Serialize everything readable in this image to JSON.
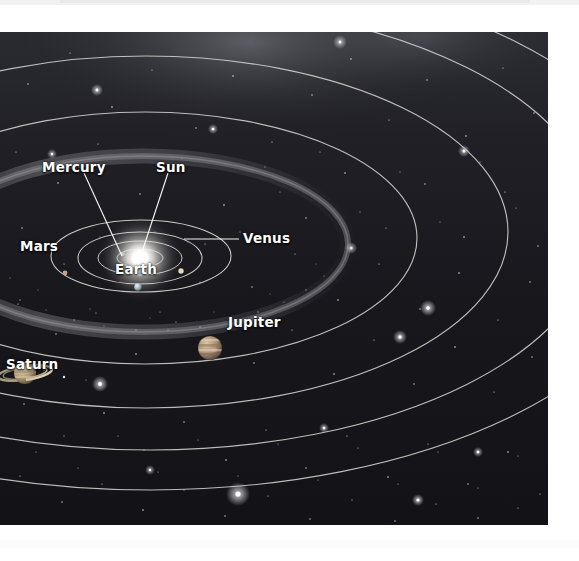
{
  "page": {
    "background": "#ffffff",
    "plate_background": "#17171c"
  },
  "diagram": {
    "type": "solar-system-orbit-diagram",
    "viewpoint": "oblique / inclined perspective view of the ecliptic plane",
    "star_color": "#ffffff",
    "orbit_line_color": "#c9c9c4",
    "sun_glow_color": "#ffffff",
    "milky_way_glow_color": "#8f8f96",
    "labels": [
      {
        "id": "mercury",
        "text": "Mercury",
        "x": 42,
        "y": 161
      },
      {
        "id": "sun",
        "text": "Sun",
        "x": 156,
        "y": 161
      },
      {
        "id": "venus",
        "text": "Venus",
        "x": 243,
        "y": 232
      },
      {
        "id": "mars",
        "text": "Mars",
        "x": 20,
        "y": 240
      },
      {
        "id": "earth",
        "text": "Earth",
        "x": 115,
        "y": 263
      },
      {
        "id": "jupiter",
        "text": "Jupiter",
        "x": 228,
        "y": 316
      },
      {
        "id": "saturn",
        "text": "Saturn",
        "x": 6,
        "y": 358
      }
    ],
    "bodies": [
      {
        "id": "sun",
        "name": "Sun",
        "cx": 140,
        "cy": 226,
        "r": 9,
        "color": "#ffffff"
      },
      {
        "id": "mercury",
        "name": "Mercury",
        "cx": 123,
        "cy": 222,
        "r": 1.8,
        "color": "#cfc8bd"
      },
      {
        "id": "venus",
        "name": "Venus",
        "cx": 181,
        "cy": 239,
        "r": 2.6,
        "color": "#ded3b8"
      },
      {
        "id": "earth",
        "name": "Earth",
        "cx": 138,
        "cy": 255,
        "r": 3.6,
        "color": "#b9c6cf"
      },
      {
        "id": "mars",
        "name": "Mars",
        "cx": 65,
        "cy": 241,
        "r": 2.4,
        "color": "#c9a187"
      },
      {
        "id": "jupiter",
        "name": "Jupiter",
        "cx": 210,
        "cy": 316,
        "r": 12,
        "color": "#b49c82"
      },
      {
        "id": "saturn",
        "name": "Saturn",
        "cx": 25,
        "cy": 341,
        "r": 11,
        "color": "#c2ab8b"
      }
    ],
    "features": [
      {
        "id": "asteroid-belt",
        "name": "Asteroid belt",
        "description": "dusty band between Mars and Jupiter"
      },
      {
        "id": "saturn-rings",
        "name": "Saturn ring system"
      },
      {
        "id": "milky-way-glow",
        "name": "Galactic glow along upper sky"
      }
    ],
    "leader_lines": [
      {
        "from": "mercury-label",
        "to": "mercury-body"
      },
      {
        "from": "sun-label",
        "to": "sun-body"
      },
      {
        "from": "venus-label",
        "to": "venus-body"
      }
    ]
  }
}
